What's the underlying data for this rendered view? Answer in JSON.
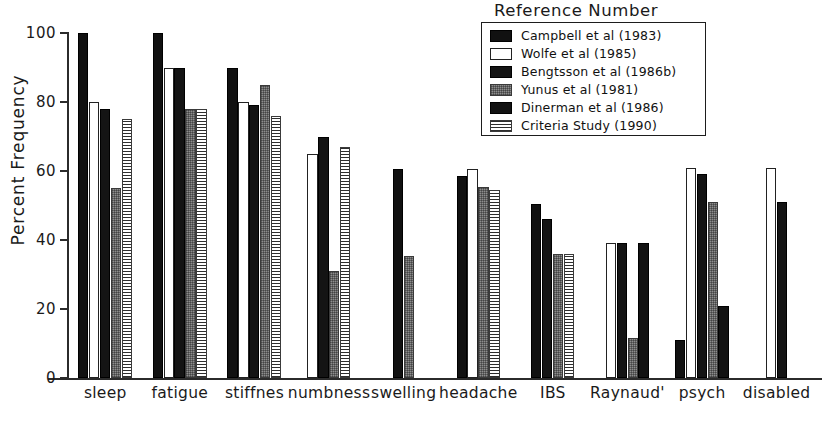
{
  "chart_data": {
    "type": "bar",
    "title": "",
    "xlabel": "",
    "ylabel": "Percent Frequency",
    "ylim": [
      0,
      100
    ],
    "yticks": [
      0,
      20,
      40,
      60,
      80,
      100
    ],
    "grid": false,
    "legend_title": "Reference Number",
    "legend_position": "top-right",
    "categories": [
      "sleep",
      "fatigue",
      "stiffnes",
      "numbness",
      "swelling",
      "headache",
      "IBS",
      "Raynaud'",
      "psych",
      "disabled"
    ],
    "series": [
      {
        "name": "Campbell et al (1983)",
        "swatch": "sw-black",
        "values": [
          100,
          100,
          90,
          null,
          60.5,
          58.5,
          50.5,
          null,
          11,
          null
        ]
      },
      {
        "name": "Wolfe et al (1985)",
        "swatch": "sw-white",
        "values": [
          80,
          90,
          80,
          65,
          null,
          60.5,
          null,
          39,
          61,
          61
        ]
      },
      {
        "name": "Bengtsson et al (1986b)",
        "swatch": "sw-dark",
        "values": [
          78,
          90,
          79,
          70,
          null,
          null,
          46,
          39,
          59,
          51
        ]
      },
      {
        "name": "Yunus et al (1981)",
        "swatch": "sw-gray",
        "values": [
          55,
          78,
          85,
          31,
          35.5,
          55.5,
          36,
          11.5,
          51,
          null
        ]
      },
      {
        "name": "Dinerman et al (1986)",
        "swatch": "sw-dinerman",
        "values": [
          null,
          null,
          null,
          null,
          null,
          null,
          null,
          39,
          21,
          null
        ]
      },
      {
        "name": "Criteria Study (1990)",
        "swatch": "sw-hatch",
        "values": [
          75,
          78,
          76,
          67,
          null,
          54.5,
          36,
          null,
          null,
          null
        ]
      }
    ]
  },
  "legend": {
    "title": "Reference Number",
    "items": [
      {
        "label": "Campbell et al (1983)",
        "swatch": "sw-black"
      },
      {
        "label": "Wolfe et al (1985)",
        "swatch": "sw-white"
      },
      {
        "label": "Bengtsson et al (1986b)",
        "swatch": "sw-dark"
      },
      {
        "label": "Yunus et al (1981)",
        "swatch": "sw-gray"
      },
      {
        "label": "Dinerman et al (1986)",
        "swatch": "sw-dinerman"
      },
      {
        "label": "Criteria Study (1990)",
        "swatch": "sw-hatch"
      }
    ]
  },
  "axis": {
    "y_label": "Percent Frequency",
    "y_ticks": [
      "0",
      "20",
      "40",
      "60",
      "80",
      "100"
    ],
    "x_ticks": [
      "sleep",
      "fatigue",
      "stiffnes",
      "numbness",
      "swelling",
      "headache",
      "IBS",
      "Raynaud'",
      "psych",
      "disabled"
    ]
  },
  "colors": {
    "axis": "#2b2b2b",
    "text": "#1a1a1a",
    "bar_black": "#111111",
    "bar_white": "#ffffff",
    "bar_gray": "#8d8d8d",
    "background": "#ffffff"
  }
}
